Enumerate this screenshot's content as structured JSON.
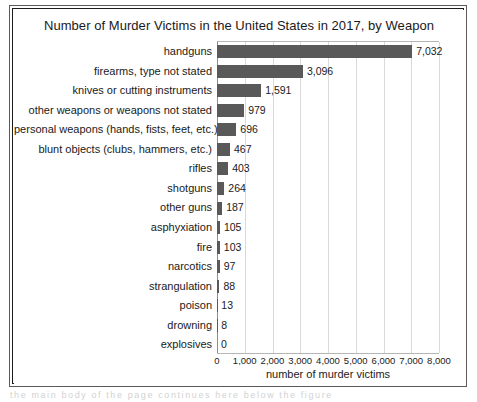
{
  "figure": {
    "title": "Number of Murder Victims in the United States in 2017, by Weapon",
    "background_color": "#ffffff",
    "frame_color": "#1c1c1c"
  },
  "chart_data": {
    "type": "bar",
    "orientation": "horizontal",
    "title": "Number of Murder Victims in the United States in 2017, by Weapon",
    "xlabel": "number of murder victims",
    "ylabel": "",
    "xlim": [
      0,
      8000
    ],
    "grid": true,
    "legend": false,
    "bar_color": "#595959",
    "xticks": [
      0,
      1000,
      2000,
      3000,
      4000,
      5000,
      6000,
      7000,
      8000
    ],
    "xtick_labels": [
      "0",
      "1,000",
      "2,000",
      "3,000",
      "4,000",
      "5,000",
      "6,000",
      "7,000",
      "8,000"
    ],
    "categories": [
      "handguns",
      "firearms, type not stated",
      "knives or cutting instruments",
      "other weapons or weapons not stated",
      "personal weapons (hands, fists, feet, etc.)",
      "blunt objects (clubs, hammers, etc.)",
      "rifles",
      "shotguns",
      "other guns",
      "asphyxiation",
      "fire",
      "narcotics",
      "strangulation",
      "poison",
      "drowning",
      "explosives"
    ],
    "values": [
      7032,
      3096,
      1591,
      979,
      696,
      467,
      403,
      264,
      187,
      105,
      103,
      97,
      88,
      13,
      8,
      0
    ],
    "value_labels": [
      "7,032",
      "3,096",
      "1,591",
      "979",
      "696",
      "467",
      "403",
      "264",
      "187",
      "105",
      "103",
      "97",
      "88",
      "13",
      "8",
      "0"
    ]
  },
  "page_text_below": "the  main  body  of  the  page  continues  here  below  the  figure"
}
